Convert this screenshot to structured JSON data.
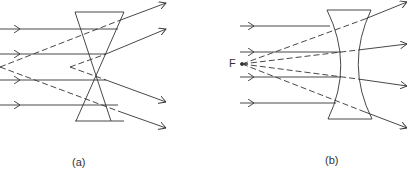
{
  "figures": [
    {
      "id": "a",
      "caption": "(a)",
      "description": "Diverging rays through lens with crossing paths"
    },
    {
      "id": "b",
      "caption": "(b)",
      "description": "Concave (diverging) lens with focal point F"
    }
  ],
  "focal_label": "F",
  "colors": {
    "line": "#333333",
    "background": "#ffffff"
  }
}
